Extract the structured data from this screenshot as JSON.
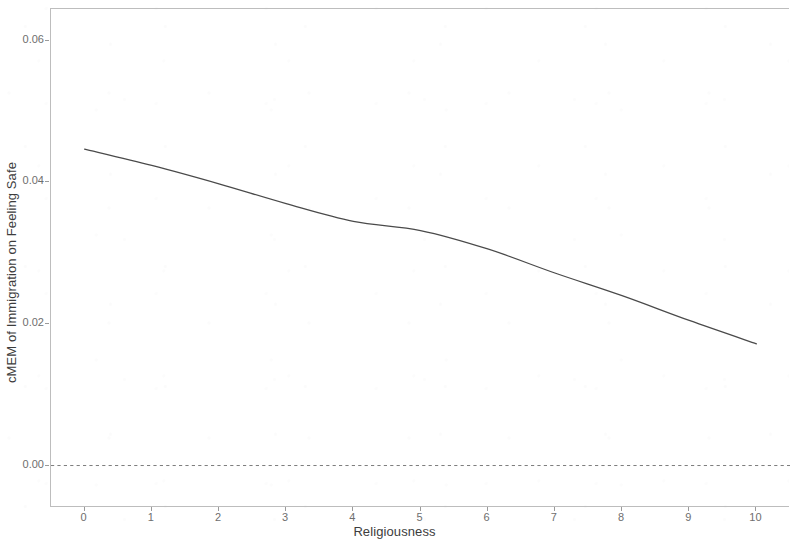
{
  "chart_data": {
    "type": "line",
    "title": "",
    "xlabel": "Religiousness",
    "ylabel": "cMEM of Immigration on Feeling Safe",
    "xlim": [
      -0.5,
      10.5
    ],
    "ylim": [
      -0.006,
      0.0645
    ],
    "grid": false,
    "legend": null,
    "x_ticks": [
      "0",
      "1",
      "2",
      "3",
      "4",
      "5",
      "6",
      "7",
      "8",
      "9",
      "10"
    ],
    "x_tick_values": [
      0,
      1,
      2,
      3,
      4,
      5,
      6,
      7,
      8,
      9,
      10
    ],
    "y_ticks": [
      "0.00",
      "0.02",
      "0.04",
      "0.06"
    ],
    "y_tick_values": [
      0.0,
      0.02,
      0.04,
      0.06
    ],
    "series": [
      {
        "name": "cMEM of Immigration on Feeling Safe",
        "style": "solid",
        "color": "#4a4a4a",
        "x": [
          0,
          1,
          2,
          3,
          4,
          5,
          6,
          7,
          8,
          9,
          10
        ],
        "values": [
          0.0447,
          0.0424,
          0.0398,
          0.037,
          0.0345,
          0.0332,
          0.0306,
          0.0272,
          0.024,
          0.0205,
          0.0172
        ]
      }
    ],
    "reference_lines": [
      {
        "name": "zero-line",
        "orientation": "horizontal",
        "value": 0.0,
        "style": "dashed",
        "color": "#7d7d7d"
      }
    ]
  },
  "axes": {
    "y_title": "cMEM of Immigration on Feeling Safe",
    "x_title": "Religiousness"
  }
}
